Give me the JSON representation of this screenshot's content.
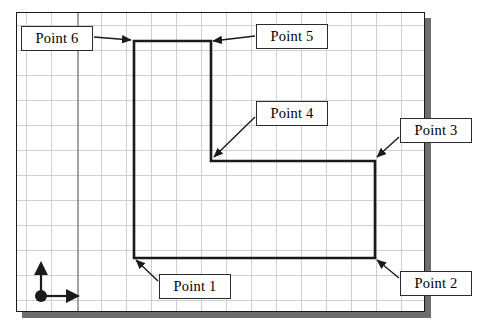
{
  "diagram": {
    "frame": {
      "x": 16,
      "y": 12,
      "width": 409,
      "height": 300,
      "border_color": "#1a1a1a",
      "shadow_color": "#6e6e6e",
      "background": "#ffffff"
    },
    "grid": {
      "spacing_x": 25,
      "spacing_y": 25,
      "minor_color": "#cfcfcf",
      "major_color": "#8d8d8d",
      "axis_line_x": 77,
      "show": true
    },
    "origin_marker": {
      "name": "origin-axes",
      "x": 40,
      "y": 295,
      "dot_radius": 6,
      "x_arrow_length": 32,
      "y_arrow_length": 30,
      "color": "#1a1a1a"
    },
    "polygon": {
      "name": "l-shape",
      "stroke": "#1a1a1a",
      "stroke_width": 2.6,
      "fill": "none",
      "vertices": [
        {
          "id": "Point 1",
          "x": 133,
          "y": 257
        },
        {
          "id": "Point 2",
          "x": 374,
          "y": 257
        },
        {
          "id": "Point 3",
          "x": 374,
          "y": 160
        },
        {
          "id": "Point 4",
          "x": 210,
          "y": 160
        },
        {
          "id": "Point 5",
          "x": 210,
          "y": 40
        },
        {
          "id": "Point 6",
          "x": 133,
          "y": 40
        }
      ]
    },
    "callouts": [
      {
        "name": "callout-point-6",
        "label": "Point 6",
        "box": {
          "x": 21,
          "y": 26,
          "width": 72,
          "height": 25
        },
        "arrow": {
          "from_x": 94,
          "from_y": 37,
          "to_x": 131,
          "to_y": 40
        }
      },
      {
        "name": "callout-point-5",
        "label": "Point 5",
        "box": {
          "x": 256,
          "y": 24,
          "width": 72,
          "height": 25
        },
        "arrow": {
          "from_x": 255,
          "from_y": 36,
          "to_x": 212,
          "to_y": 41
        }
      },
      {
        "name": "callout-point-4",
        "label": "Point 4",
        "box": {
          "x": 256,
          "y": 101,
          "width": 72,
          "height": 25
        },
        "arrow": {
          "from_x": 255,
          "from_y": 117,
          "to_x": 213,
          "to_y": 157
        }
      },
      {
        "name": "callout-point-3",
        "label": "Point 3",
        "box": {
          "x": 400,
          "y": 118,
          "width": 72,
          "height": 25
        },
        "arrow": {
          "from_x": 399,
          "from_y": 137,
          "to_x": 376,
          "to_y": 157
        }
      },
      {
        "name": "callout-point-1",
        "label": "Point 1",
        "box": {
          "x": 159,
          "y": 274,
          "width": 72,
          "height": 25
        },
        "arrow": {
          "from_x": 158,
          "from_y": 281,
          "to_x": 135,
          "to_y": 260
        }
      },
      {
        "name": "callout-point-2",
        "label": "Point 2",
        "box": {
          "x": 400,
          "y": 271,
          "width": 72,
          "height": 25
        },
        "arrow": {
          "from_x": 399,
          "from_y": 278,
          "to_x": 376,
          "to_y": 260
        }
      }
    ]
  }
}
